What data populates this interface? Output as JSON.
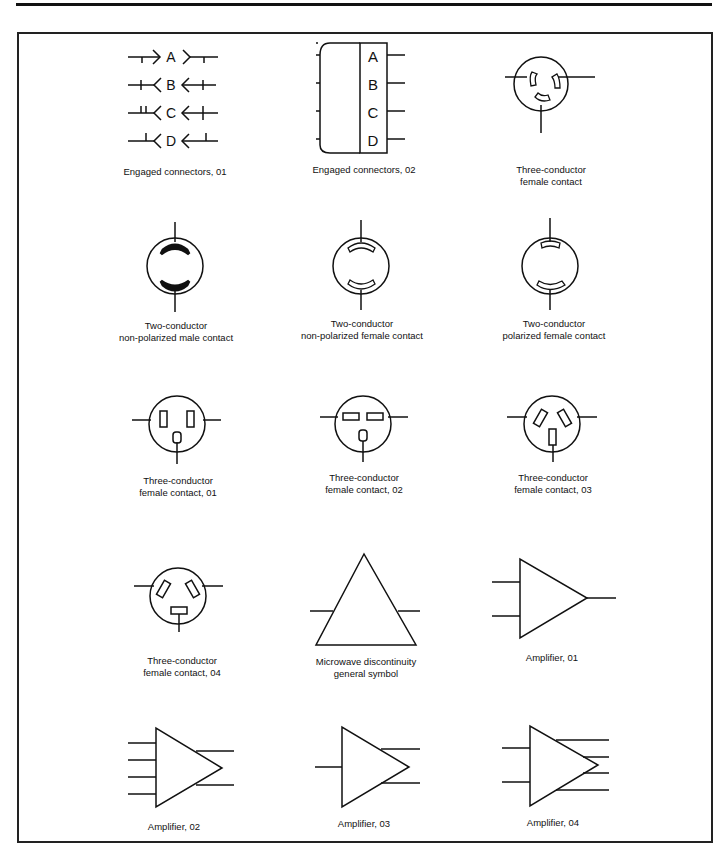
{
  "page": {
    "symbols": [
      {
        "id": "engaged-connectors-01",
        "caption": "Engaged connectors, 01",
        "letters": [
          "A",
          "B",
          "C",
          "D"
        ]
      },
      {
        "id": "engaged-connectors-02",
        "caption": "Engaged connectors, 02",
        "letters": [
          "A",
          "B",
          "C",
          "D"
        ]
      },
      {
        "id": "three-conductor-female-contact",
        "caption": "Three-conductor\nfemale contact"
      },
      {
        "id": "two-conductor-non-polarized-male-contact",
        "caption": "Two-conductor\nnon-polarized male contact"
      },
      {
        "id": "two-conductor-non-polarized-female-contact",
        "caption": "Two-conductor\nnon-polarized female contact"
      },
      {
        "id": "two-conductor-polarized-female-contact",
        "caption": "Two-conductor\npolarized female contact"
      },
      {
        "id": "three-conductor-female-contact-01",
        "caption": "Three-conductor\nfemale contact, 01"
      },
      {
        "id": "three-conductor-female-contact-02",
        "caption": "Three-conductor\nfemale contact, 02"
      },
      {
        "id": "three-conductor-female-contact-03",
        "caption": "Three-conductor\nfemale contact, 03"
      },
      {
        "id": "three-conductor-female-contact-04",
        "caption": "Three-conductor\nfemale contact, 04"
      },
      {
        "id": "microwave-discontinuity-general-symbol",
        "caption": "Microwave discontinuity\ngeneral symbol"
      },
      {
        "id": "amplifier-01",
        "caption": "Amplifier, 01"
      },
      {
        "id": "amplifier-02",
        "caption": "Amplifier, 02"
      },
      {
        "id": "amplifier-03",
        "caption": "Amplifier, 03"
      },
      {
        "id": "amplifier-04",
        "caption": "Amplifier, 04"
      }
    ]
  }
}
